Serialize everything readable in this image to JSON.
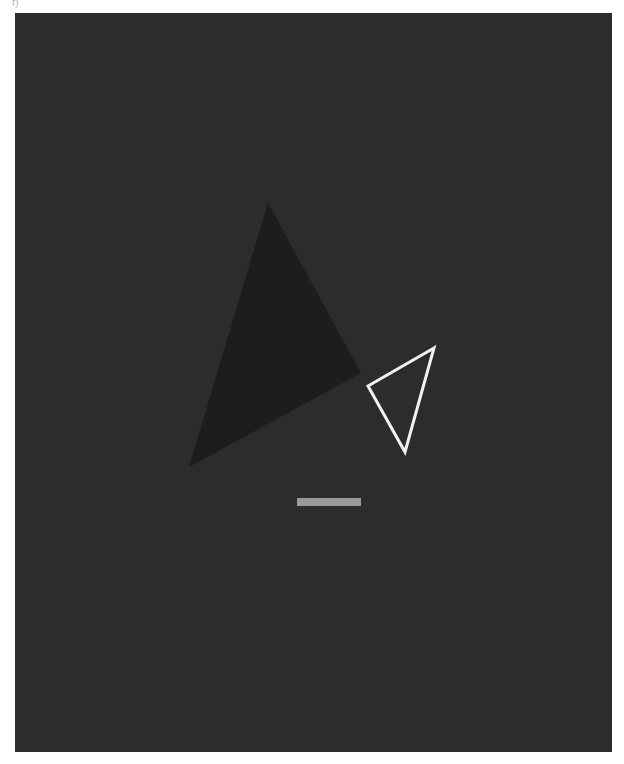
{
  "figure": {
    "label": "f)",
    "background_color": "#2c2c2c"
  },
  "shapes": {
    "filled_triangle": {
      "points": "253,190 346,360 174,454",
      "fill": "#1d1d1d"
    },
    "outline_triangle": {
      "points": "419,335 353,373 390,439",
      "stroke": "#f2f2f2"
    },
    "bar": {
      "x": 282,
      "y": 485,
      "width": 64,
      "height": 8,
      "fill": "#9a9a9a"
    }
  }
}
